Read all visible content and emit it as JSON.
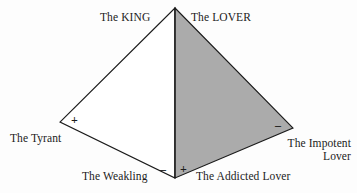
{
  "diagram": {
    "colors": {
      "background": "#fdfdfd",
      "stroke": "#1b1b1b",
      "shaded_fill": "#ababab",
      "unshaded_fill": "#ffffff"
    },
    "geometry": {
      "apex": [
        175,
        8
      ],
      "left_vertex": [
        60,
        122
      ],
      "right_vertex": [
        293,
        128
      ],
      "bottom_vertex": [
        175,
        178
      ]
    },
    "labels": {
      "king": "The KING",
      "lover": "The LOVER",
      "tyrant": "The Tyrant",
      "impotent_lover": "The Impotent Lover",
      "weakling": "The Weakling",
      "addicted_lover": "The Addicted Lover"
    },
    "signs": {
      "tyrant_polarity": "+",
      "impotent_polarity": "–",
      "weakling_polarity": "–",
      "addicted_polarity": "+"
    }
  }
}
